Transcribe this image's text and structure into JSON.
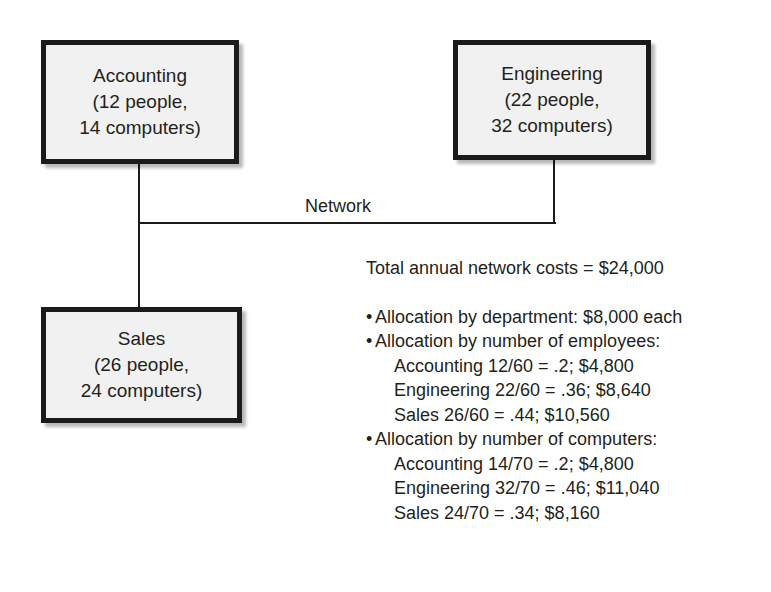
{
  "diagram": {
    "departments": [
      {
        "id": "accounting",
        "name": "Accounting",
        "people_line": "(12 people,",
        "computers_line": "14 computers)",
        "people": 12,
        "computers": 14
      },
      {
        "id": "engineering",
        "name": "Engineering",
        "people_line": "(22 people,",
        "computers_line": "32 computers)",
        "people": 22,
        "computers": 32
      },
      {
        "id": "sales",
        "name": "Sales",
        "people_line": "(26 people,",
        "computers_line": "24 computers)",
        "people": 26,
        "computers": 24
      }
    ],
    "network_label": "Network"
  },
  "notes": {
    "total": "Total annual network costs = $24,000",
    "by_department": "Allocation by department: $8,000 each",
    "by_employees": {
      "heading": "Allocation by number of employees:",
      "lines": [
        "Accounting 12/60 = .2; $4,800",
        "Engineering 22/60 = .36; $8,640",
        "Sales 26/60 = .44; $10,560"
      ]
    },
    "by_computers": {
      "heading": "Allocation by number of computers:",
      "lines": [
        "Accounting 14/70 = .2; $4,800",
        "Engineering 32/70 = .46; $11,040",
        "Sales 24/70 = .34; $8,160"
      ]
    }
  }
}
